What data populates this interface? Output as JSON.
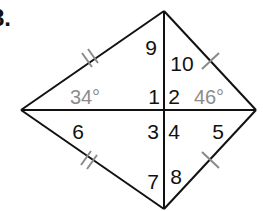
{
  "problem": {
    "number_label": "8."
  },
  "figure": {
    "type": "kite",
    "vertices": {
      "top": [
        164,
        11
      ],
      "right": [
        256,
        110
      ],
      "bottom": [
        164,
        209
      ],
      "left": [
        21,
        110
      ]
    },
    "diagonals_intersection": [
      164,
      110
    ],
    "colors": {
      "stroke": "#111111",
      "tick": "#8a8a8a",
      "given_angle_text": "#8c8c8c",
      "label_text": "#111111"
    },
    "angle_labels": [
      {
        "id": "1",
        "text": "1",
        "x": 154,
        "y": 104
      },
      {
        "id": "2",
        "text": "2",
        "x": 174,
        "y": 104
      },
      {
        "id": "3",
        "text": "3",
        "x": 153,
        "y": 139
      },
      {
        "id": "4",
        "text": "4",
        "x": 174,
        "y": 139
      },
      {
        "id": "5",
        "text": "5",
        "x": 218,
        "y": 139
      },
      {
        "id": "6",
        "text": "6",
        "x": 78,
        "y": 139
      },
      {
        "id": "7",
        "text": "7",
        "x": 153,
        "y": 189
      },
      {
        "id": "8",
        "text": "8",
        "x": 176,
        "y": 184
      },
      {
        "id": "9",
        "text": "9",
        "x": 151,
        "y": 55
      },
      {
        "id": "10",
        "text": "10",
        "x": 182,
        "y": 71
      }
    ],
    "given_angles": [
      {
        "id": "left-angle",
        "text": "34°",
        "x": 85,
        "y": 104
      },
      {
        "id": "right-angle",
        "text": "46°",
        "x": 209,
        "y": 104
      }
    ],
    "congruence_marks": [
      {
        "edge": "top-left",
        "ticks": 2
      },
      {
        "edge": "bottom-left",
        "ticks": 2
      },
      {
        "edge": "top-right",
        "ticks": 1
      },
      {
        "edge": "bottom-right",
        "ticks": 1
      }
    ]
  }
}
